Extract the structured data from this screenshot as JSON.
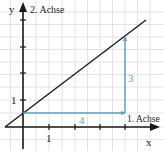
{
  "diagram": {
    "type": "coordinate-system-slope-triangle",
    "axes": {
      "x_label": "x",
      "x_axis_name": "1. Achse",
      "y_label": "y",
      "y_axis_name": "2. Achse",
      "x_tick_label": "1",
      "y_tick_label": "1"
    },
    "line": {
      "description": "Gerade mit Steigung 3/4 und y-Achsenabschnitt 0.5",
      "slope": 0.75,
      "intercept": 0.5,
      "color": "#1a1a1a"
    },
    "slope_triangle": {
      "horizontal_label": "4",
      "vertical_label": "3",
      "color": "#5a9ec2"
    },
    "grid_color": "#e2e2e2"
  }
}
